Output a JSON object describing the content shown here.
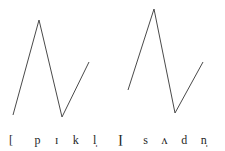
{
  "figure": {
    "background_color": "#ffffff",
    "line_color": "#4a4a4a",
    "text_color": "#262626"
  },
  "chart_data": [
    {
      "type": "line",
      "title": "",
      "name": "pitch-contour-pickle",
      "transcription": "[pɪkl̩]",
      "word": "pickle",
      "xlabel": "",
      "ylabel": "",
      "grid": false,
      "legend": "none",
      "xlim": [
        0,
        113
      ],
      "ylim": [
        0,
        125
      ],
      "note": "y values are pixel rows measured from the top of the panel; lower row number = higher pitch",
      "x": [
        13,
        39,
        62,
        89
      ],
      "y": [
        115,
        20,
        117,
        62
      ],
      "points": [
        {
          "x": 13,
          "y": 115,
          "role": "onset"
        },
        {
          "x": 39,
          "y": 20,
          "role": "peak"
        },
        {
          "x": 62,
          "y": 117,
          "role": "valley"
        },
        {
          "x": 89,
          "y": 62,
          "role": "offset"
        }
      ]
    },
    {
      "type": "line",
      "title": "",
      "name": "pitch-contour-sudden",
      "transcription": "[sʌdn̩]",
      "word": "sudden",
      "xlabel": "",
      "ylabel": "",
      "grid": false,
      "legend": "none",
      "xlim": [
        0,
        112
      ],
      "ylim": [
        0,
        125
      ],
      "note": "y values are pixel rows measured from the top of the panel; lower row number = higher pitch",
      "x": [
        15,
        41,
        62,
        90
      ],
      "y": [
        90,
        9,
        113,
        62
      ],
      "points": [
        {
          "x": 15,
          "y": 90,
          "role": "onset"
        },
        {
          "x": 41,
          "y": 9,
          "role": "peak"
        },
        {
          "x": 62,
          "y": 113,
          "role": "valley"
        },
        {
          "x": 90,
          "y": 62,
          "role": "offset"
        }
      ]
    }
  ],
  "panels": [
    {
      "id": "pickle",
      "path": "M 13 115 L 39 20 L 62 117 L 89 62",
      "transcription": {
        "open_bracket": "[",
        "segments": [
          "p",
          "ɪ",
          "k",
          "l̩"
        ],
        "close_bracket": "]"
      }
    },
    {
      "id": "sudden",
      "path": "M 15 90 L 41 9 L 62 113 L 90 62",
      "transcription": {
        "open_bracket": "[",
        "segments": [
          "s",
          "ʌ",
          "d",
          "n̩"
        ],
        "close_bracket": "]"
      }
    }
  ]
}
